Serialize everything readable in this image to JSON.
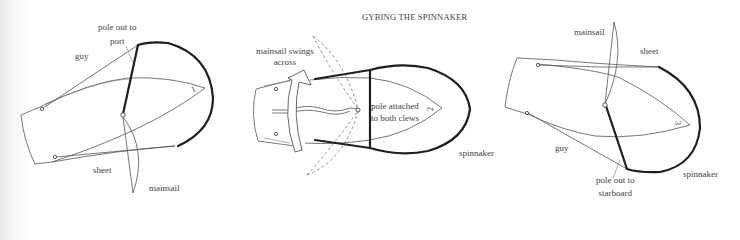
{
  "title": "GYBING THE SPINNAKER",
  "diagrams": [
    {
      "step": "1",
      "labels": {
        "pole": "pole out to",
        "pole_line2": "port",
        "guy": "guy",
        "sheet": "sheet",
        "mainsail": "mainsail"
      }
    },
    {
      "step": "2",
      "labels": {
        "mainsail_swings": "mainsail swings",
        "mainsail_swings_line2": "across",
        "pole_attached": "pole attached",
        "pole_attached_line2": "to both clews",
        "spinnaker": "spinnaker"
      }
    },
    {
      "step": "3",
      "labels": {
        "mainsail": "mainsail",
        "sheet": "sheet",
        "guy": "guy",
        "pole": "pole out to",
        "pole_line2": "starboard",
        "spinnaker": "spinnaker"
      }
    }
  ]
}
